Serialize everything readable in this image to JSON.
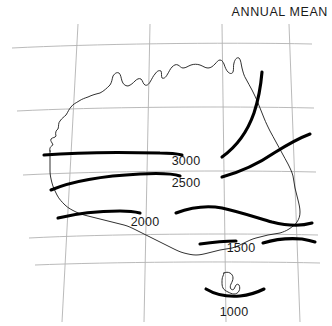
{
  "title": "ANNUAL MEAN",
  "colors": {
    "background": "#ffffff",
    "coastline": "#1a1a1a",
    "contour": "#000000",
    "graticule": "#b2b2b2",
    "text": "#1a1a1a"
  },
  "chart_data": {
    "type": "contour_map",
    "title": "ANNUAL MEAN",
    "subtitle": "",
    "xlabel": "",
    "ylabel": "",
    "region": "Australia",
    "grid": true,
    "legend": "none",
    "contour_unit": "",
    "contour_levels": [
      1000,
      1500,
      2000,
      2500,
      3000
    ],
    "contours": [
      {
        "level": 3000,
        "label": "3000",
        "label_x": 186,
        "label_y": 162,
        "segments": [
          "M 44,155 C 80,152 120,152 160,153 C 172,153 178,154 182,155",
          "M 222,157 C 236,147 247,133 254,113 C 259,98 261,84 262,72"
        ]
      },
      {
        "level": 2500,
        "label": "2500",
        "label_x": 186,
        "label_y": 184,
        "segments": [
          "M 51,190 C 70,182 100,176 140,174 C 160,173 174,174 180,176",
          "M 222,177 C 240,172 258,164 274,153 C 290,143 302,137 310,134"
        ]
      },
      {
        "level": 2000,
        "label": "2000",
        "label_x": 145,
        "label_y": 223,
        "segments": [
          "M 58,218 C 78,213 100,211 120,211 C 130,211 136,212 140,213",
          "M 176,213 C 192,207 206,205 222,208 C 240,212 258,218 272,222 C 288,226 302,226 312,223"
        ]
      },
      {
        "level": 1500,
        "label": "1500",
        "label_x": 241,
        "label_y": 249,
        "segments": [
          "M 200,244 C 214,242 226,241 236,241",
          "M 263,243 C 276,239 290,238 302,239 C 308,240 312,241 315,242"
        ]
      },
      {
        "level": 1000,
        "label": "1000",
        "label_x": 234,
        "label_y": 313,
        "segments": [
          "M 206,289 C 216,295 228,297 240,296 C 250,295 258,292 264,289"
        ]
      }
    ],
    "graticule": {
      "meridians": [
        "M 78,24 L 62,322",
        "M 150,24 L 144,322",
        "M 222,24 L 226,322",
        "M 289,24 L 300,322"
      ],
      "parallels": [
        "M 12,48 C 90,44 220,42 312,44",
        "M 17,111 C 95,107 224,106 314,108",
        "M 23,175 C 100,171 228,170 316,172",
        "M 29,238 C 105,234 232,233 318,235",
        "M 35,265 C 110,262 235,261 320,263"
      ]
    }
  },
  "coastline": {
    "mainland": "M 50,151 C 49,148 51,146 53,145 C 52,142 50,141 51,139 C 53,137 55,138 56,136 C 55,133 56,130 58,129 C 59,126 58,123 60,121 C 62,118 64,117 66,115 C 68,112 69,109 71,107 C 73,104 76,103 79,101 C 82,99 85,98 88,97 C 92,95 96,94 100,93 C 104,91 107,88 110,85 C 112,82 112,79 113,76 C 115,73 117,72 119,73 C 121,75 121,78 122,81 C 123,84 125,86 128,86 C 131,85 133,83 135,81 C 137,79 139,78 141,79 C 143,81 143,84 145,85 C 147,86 149,84 150,82 C 152,79 153,76 155,74 C 157,71 159,70 161,71 C 162,73 161,76 162,78 C 164,79 166,77 167,75 C 169,72 170,69 172,67 C 174,65 176,64 178,65 C 180,66 181,68 183,68 C 186,68 188,66 191,65 C 194,64 197,64 200,65 C 203,66 205,68 208,68 C 211,68 213,66 215,64 C 217,62 218,60 220,60 C 222,60 223,62 224,64 C 225,67 226,70 228,72 C 230,74 232,74 233,72 C 234,69 233,66 234,63 C 235,59 237,57 239,58 C 241,60 241,64 242,68 C 243,72 244,76 246,79 C 248,83 250,86 252,90 C 254,94 256,98 258,103 C 260,108 262,113 264,118 C 266,123 268,127 270,131 C 272,135 274,138 276,142 C 278,146 280,149 282,153 C 284,157 286,160 288,164 C 290,168 292,172 293,176 C 294,180 294,184 295,188 C 296,192 297,196 298,200 C 299,204 300,208 300,212 C 300,216 299,219 297,222 C 295,225 292,227 289,229 C 286,231 283,232 280,233 C 276,234 272,234 268,235 C 264,236 260,237 256,238 C 252,239 248,241 244,243 C 240,245 236,247 232,248 C 228,249 224,249 220,250 C 216,251 212,252 208,253 C 204,254 200,255 196,255 C 192,255 188,254 184,253 C 180,252 176,250 172,248 C 168,246 164,244 160,242 C 156,240 152,238 148,236 C 144,234 140,232 136,230 C 132,228 128,226 124,225 C 120,224 116,223 112,222 C 108,221 104,220 100,219 C 96,218 92,217 88,216 C 84,215 80,214 76,212 C 72,210 68,208 65,205 C 62,202 59,199 57,195 C 55,191 53,187 52,183 C 51,179 50,175 50,171 C 50,167 50,163 50,159 C 50,156 50,153 50,151 Z",
    "tasmania": "M 224,273 C 226,272 228,272 230,273 C 232,274 233,276 233,278 C 233,280 232,282 231,284 C 230,286 230,288 231,289 C 232,290 233,290 234,289 C 235,288 235,286 236,285 C 237,284 238,284 239,285 C 240,287 240,289 239,291 C 238,293 236,294 234,294 C 232,294 230,293 228,292 C 226,291 224,290 223,288 C 222,286 222,284 222,282 C 222,280 222,278 223,276 C 223,275 224,274 224,273 Z"
  }
}
